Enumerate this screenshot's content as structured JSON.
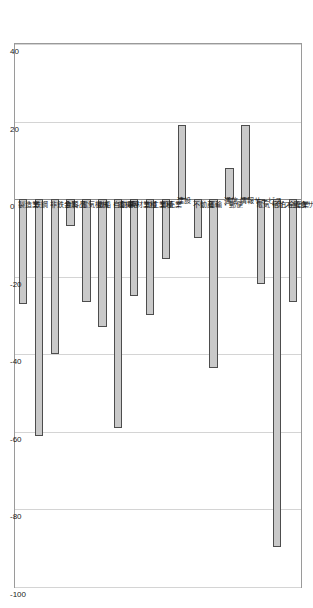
{
  "chart_data": {
    "type": "bar",
    "orientation": "horizontal-rotated",
    "title": "",
    "xlabel": "",
    "ylabel": "",
    "ylim": [
      40,
      -100
    ],
    "axis_ticks": [
      40,
      20,
      0,
      -20,
      -40,
      -60,
      -80,
      -100
    ],
    "axis_tick_labels": [
      "40",
      "20",
      "0",
      "-20",
      "-40",
      "-60",
      "-80",
      "-100"
    ],
    "grid": true,
    "legend": "none",
    "bar_fill_color": "#c9c9c9",
    "bar_edge_color": "#4d4d4d",
    "grid_color": "#d4d4d4",
    "frame_color": "#9a9a9a",
    "categories": [
      "全産業",
      "宿泊・飲食サービス",
      "電気・ガス",
      "情報サービス",
      "通信",
      "運輸・郵便",
      "不動産",
      "建設",
      "卸売業",
      "加工業種",
      "素材業種",
      "自動車",
      "造船・重機等",
      "電気機械",
      "食料品",
      "非鉄金属",
      "鉄鋼",
      "製造業"
    ],
    "values": [
      -26.6,
      -89.6,
      -22.0,
      19.0,
      8.0,
      -43.6,
      -10.0,
      19.0,
      -15.5,
      -30.0,
      -25.0,
      -59.0,
      -33.0,
      -26.5,
      -7.0,
      -40.0,
      -61.0,
      -27.0
    ]
  }
}
